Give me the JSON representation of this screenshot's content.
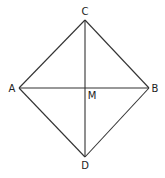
{
  "diagram": {
    "type": "geometry",
    "shape": "square-rhombus with diagonals",
    "points": {
      "A": {
        "label": "A",
        "x": 19,
        "y": 88
      },
      "B": {
        "label": "B",
        "x": 149,
        "y": 88
      },
      "C": {
        "label": "C",
        "x": 85,
        "y": 20
      },
      "D": {
        "label": "D",
        "x": 85,
        "y": 157
      },
      "M": {
        "label": "M",
        "x": 85,
        "y": 88
      }
    },
    "segments": [
      "AC",
      "CB",
      "BD",
      "DA",
      "AB",
      "CD"
    ],
    "line_color": "#333333",
    "label_color": "#222222"
  }
}
